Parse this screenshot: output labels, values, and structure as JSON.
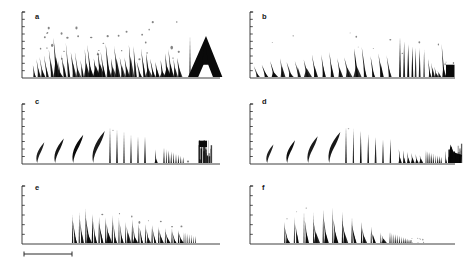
{
  "figure": {
    "kind": "oscillogram-panel-grid",
    "background": "#ffffff",
    "ink": "#0a0a0a",
    "axis_color": "#2a2a2a",
    "width": 464,
    "height": 262,
    "rows": 3,
    "cols": 2
  },
  "panels": [
    {
      "id": "a",
      "label": "a",
      "col": 0,
      "row": 0,
      "origin_x": 22,
      "origin_y": 78,
      "axis_height": 66,
      "axis_width": 198,
      "label_x": 35,
      "label_y": 19,
      "ticks": 9,
      "baseline": 60,
      "description": "long chirp train, low start amplitude rising then decaying, terminating in a large dark A-shaped terminal burst"
    },
    {
      "id": "b",
      "label": "b",
      "col": 1,
      "row": 0,
      "origin_x": 250,
      "origin_y": 78,
      "axis_height": 66,
      "axis_width": 205,
      "label_x": 262,
      "label_y": 19,
      "ticks": 9,
      "baseline": 60,
      "description": "evenly spaced pulse train with growing amplitude, a dense high-amplitude cluster near the end and a solid black terminal block"
    },
    {
      "id": "c",
      "label": "c",
      "col": 0,
      "row": 1,
      "origin_x": 22,
      "origin_y": 164,
      "axis_height": 60,
      "axis_width": 198,
      "label_x": 35,
      "label_y": 104,
      "ticks": 8,
      "baseline": 60,
      "description": "four broad isolated slanted strokes, then narrow spikes, then a compressed buzz and a dark smudge cluster at the end"
    },
    {
      "id": "d",
      "label": "d",
      "col": 1,
      "row": 1,
      "origin_x": 250,
      "origin_y": 164,
      "axis_height": 60,
      "axis_width": 205,
      "label_x": 262,
      "label_y": 104,
      "ticks": 8,
      "baseline": 60,
      "description": "broad slanted strokes followed by tall thin spikes, a decaying buzz and a dense black terminal blob"
    },
    {
      "id": "e",
      "label": "e",
      "col": 0,
      "row": 2,
      "origin_x": 22,
      "origin_y": 244,
      "axis_height": 58,
      "axis_width": 198,
      "label_x": 35,
      "label_y": 190,
      "ticks": 6,
      "baseline": 58,
      "description": "regular train of paired strokes of slowly decaying amplitude, starting mid-panel"
    },
    {
      "id": "f",
      "label": "f",
      "col": 1,
      "row": 2,
      "origin_x": 250,
      "origin_y": 244,
      "axis_height": 58,
      "axis_width": 205,
      "label_x": 262,
      "label_y": 190,
      "ticks": 6,
      "baseline": 58,
      "description": "short train of hooked strokes decaying into a compressed terminal buzz"
    }
  ],
  "scale_bar": {
    "name": "time-scale-bar",
    "x_start": 24,
    "x_end": 72,
    "y": 254,
    "cap_height": 5,
    "label": ""
  }
}
